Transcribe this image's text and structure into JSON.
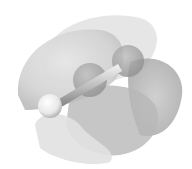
{
  "image": {
    "subject": "molecular orbital isosurface rendering",
    "background_color": "#ffffff",
    "lobe_colors": [
      "#d9d9d9",
      "#c4c4c4",
      "#b0b0b0",
      "#9c9c9c"
    ],
    "atoms": [
      {
        "name": "hydrogen-atom",
        "color": "#f4f4f4"
      },
      {
        "name": "carbon-atom-1",
        "color": "#a8a8a8"
      },
      {
        "name": "carbon-atom-2",
        "color": "#a0a0a0"
      }
    ]
  }
}
